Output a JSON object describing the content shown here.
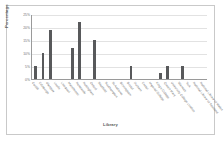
{
  "chart_data": {
    "type": "bar",
    "title": "",
    "xlabel": "Library",
    "ylabel": "Percentage",
    "ylim": [
      0,
      25
    ],
    "ytick_labels": [
      "25%",
      "20%",
      "15%",
      "10%",
      "5%",
      "0%"
    ],
    "ytick_values": [
      25,
      20,
      15,
      10,
      5,
      0
    ],
    "grid": true,
    "legend": false,
    "bar_color": "#58595b",
    "categories": [
      "Cardiff",
      "Edinburgh",
      "Glasgow",
      "Leeds",
      "Liverpool",
      "Manchester",
      "Newcastle",
      "Nottingham",
      "Oxford",
      "Sheffield",
      "Southampton",
      "St Andrews",
      "Birmingham",
      "Bristol",
      "Durham",
      "Exeter",
      "Imperial College",
      "King's College",
      "Queen Mary",
      "University College London",
      "Warwick",
      "York",
      "National Library of Scotland",
      "National Library of Wales"
    ],
    "values": [
      5,
      10,
      19,
      0,
      0,
      12,
      22,
      0,
      15,
      0,
      0,
      0,
      0,
      5,
      0,
      0,
      0,
      2.5,
      5,
      0,
      5,
      0,
      0,
      0
    ]
  }
}
